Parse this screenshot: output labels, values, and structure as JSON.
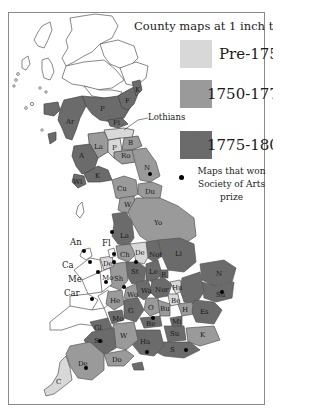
{
  "title": "County maps at 1 inch to 1 mile",
  "legend": {
    "items": [
      {
        "label": "Pre-1750",
        "color": "#d8d8d8"
      },
      {
        "label": "1750-1775",
        "color": "#9a9a9a"
      },
      {
        "label": "1775-1800",
        "color": "#6b6b6b"
      }
    ],
    "prize_label_line1": "Maps that won",
    "prize_label_line2": "Society of Arts prize"
  },
  "annotations": {
    "lothians": "Lothians"
  },
  "colors": {
    "pre1750": "#d8d8d8",
    "c1750_1775": "#9a9a9a",
    "c1775_1800": "#6b6b6b",
    "unmapped": "#ffffff",
    "border": "#555555"
  },
  "counties": [
    {
      "abbr": "P",
      "period": "1775-1800"
    },
    {
      "abbr": "F",
      "period": "1775-1800"
    },
    {
      "abbr": "K",
      "period": "1775-1800"
    },
    {
      "abbr": "Ar",
      "period": "1775-1800"
    },
    {
      "abbr": "Fi",
      "period": "1775-1800"
    },
    {
      "abbr": "La",
      "period": "1750-1775"
    },
    {
      "abbr": "P",
      "period": "Pre-1750"
    },
    {
      "abbr": "B",
      "period": "1750-1775"
    },
    {
      "abbr": "Ro",
      "period": "1750-1775"
    },
    {
      "abbr": "A",
      "period": "1775-1800"
    },
    {
      "abbr": "K",
      "period": "1775-1800"
    },
    {
      "abbr": "Wi",
      "period": "1775-1800"
    },
    {
      "abbr": "N",
      "period": "1750-1775",
      "prize": true
    },
    {
      "abbr": "Cu",
      "period": "1750-1775"
    },
    {
      "abbr": "Du",
      "period": "1750-1775"
    },
    {
      "abbr": "W",
      "period": "1750-1775"
    },
    {
      "abbr": "Yo",
      "period": "1750-1775"
    },
    {
      "abbr": "La",
      "period": "1775-1800",
      "prize": true
    },
    {
      "abbr": "Ch",
      "period": "1750-1775"
    },
    {
      "abbr": "De",
      "period": "Pre-1750",
      "prize": true
    },
    {
      "abbr": "Not",
      "period": "1775-1800"
    },
    {
      "abbr": "Li",
      "period": "1775-1800"
    },
    {
      "abbr": "St",
      "period": "1775-1800"
    },
    {
      "abbr": "Le",
      "period": "1775-1800"
    },
    {
      "abbr": "R",
      "period": "1775-1800"
    },
    {
      "abbr": "Sh",
      "period": "1750-1775",
      "prize": true
    },
    {
      "abbr": "Wo",
      "period": "1750-1775"
    },
    {
      "abbr": "Wa",
      "period": "1775-1800"
    },
    {
      "abbr": "Nor",
      "period": "1775-1800"
    },
    {
      "abbr": "Hu",
      "period": "Pre-1750"
    },
    {
      "abbr": "Be",
      "period": "Pre-1750"
    },
    {
      "abbr": "N",
      "period": "1775-1800"
    },
    {
      "abbr": "Su",
      "period": "1775-1800",
      "prize": true
    },
    {
      "abbr": "He",
      "period": "1750-1775"
    },
    {
      "abbr": "G",
      "period": "1775-1800"
    },
    {
      "abbr": "O",
      "period": "1750-1775",
      "prize": true
    },
    {
      "abbr": "Bu",
      "period": "1750-1775"
    },
    {
      "abbr": "H",
      "period": "1750-1775"
    },
    {
      "abbr": "Mo",
      "period": "1775-1800"
    },
    {
      "abbr": "Gl",
      "period": "1775-1800"
    },
    {
      "abbr": "Be",
      "period": "1775-1800"
    },
    {
      "abbr": "Mi",
      "period": "1775-1800"
    },
    {
      "abbr": "Es",
      "period": "1775-1800"
    },
    {
      "abbr": "W",
      "period": "1750-1775"
    },
    {
      "abbr": "So",
      "period": "1775-1800",
      "prize": true
    },
    {
      "abbr": "Ha",
      "period": "1775-1800",
      "prize": true
    },
    {
      "abbr": "Su",
      "period": "1775-1800"
    },
    {
      "abbr": "K",
      "period": "1750-1775"
    },
    {
      "abbr": "S",
      "period": "1775-1800",
      "prize": true
    },
    {
      "abbr": "Do",
      "period": "1750-1775"
    },
    {
      "abbr": "De",
      "period": "1750-1775",
      "prize": true
    },
    {
      "abbr": "C",
      "period": "Pre-1750"
    }
  ],
  "wales_labels": [
    "An",
    "Fl",
    "Ca",
    "De",
    "Me",
    "Mo",
    "Car"
  ],
  "wales_prize_counties": [
    "An",
    "Ca",
    "Fl",
    "Me",
    "Mo",
    "Car",
    "De"
  ]
}
